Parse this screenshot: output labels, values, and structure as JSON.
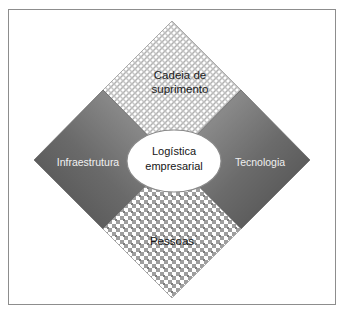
{
  "figure": {
    "background_color": "#ffffff",
    "frame_color": "#8d8d8d"
  },
  "center": {
    "name": "center-ellipse",
    "label": "Logística\nempresarial",
    "fill_color": "#ffffff",
    "stroke_color": "#8a8a8a"
  },
  "quadrants": [
    {
      "id": "cadeia-de-suprimento",
      "position": "top",
      "label": "Cadeia de\nsuprimento",
      "text_color": "#1c1c1c",
      "fill_style": "diagonal-crosshatch",
      "fill_color": "#ffffff",
      "pattern_color": "#b8b8b8"
    },
    {
      "id": "infraestrutura",
      "position": "left",
      "label": "Infraestrutura",
      "text_color": "#f2f2f2",
      "fill_style": "gray-gradient",
      "fill_color": "#6f6f6f",
      "pattern_color": "#4a4a4a"
    },
    {
      "id": "tecnologia",
      "position": "right",
      "label": "Tecnologia",
      "text_color": "#f0f0f0",
      "fill_style": "gray-gradient",
      "fill_color": "#6f6f6f",
      "pattern_color": "#4a4a4a"
    },
    {
      "id": "pessoas",
      "position": "bottom",
      "label": "Pessoas",
      "text_color": "#171717",
      "fill_style": "grid-dots",
      "fill_color": "#ffffff",
      "pattern_color": "#9a9a9a"
    }
  ]
}
